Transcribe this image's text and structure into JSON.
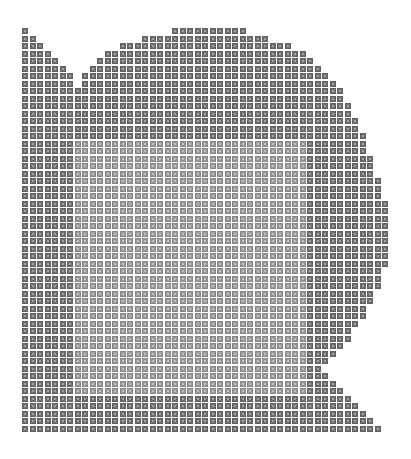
{
  "figure": {
    "grid": {
      "origin_x": 22,
      "origin_y": 28,
      "pitch": 7.5,
      "cell_size": 6
    },
    "colors": {
      "outer": "#6f6f6f",
      "inner": "#9a9a9a",
      "background": "#ffffff"
    },
    "inner_region": {
      "col_start": 7,
      "col_end": 37,
      "row_start": 15,
      "row_end": 48
    },
    "rows": [
      [
        [
          0,
          0
        ],
        [
          20,
          29
        ]
      ],
      [
        [
          0,
          1
        ],
        [
          16,
          32
        ]
      ],
      [
        [
          0,
          2
        ],
        [
          13,
          35
        ]
      ],
      [
        [
          0,
          3
        ],
        [
          11,
          37
        ]
      ],
      [
        [
          0,
          4
        ],
        [
          10,
          38
        ]
      ],
      [
        [
          0,
          5
        ],
        [
          9,
          39
        ]
      ],
      [
        [
          0,
          6
        ],
        [
          8,
          40
        ]
      ],
      [
        [
          0,
          6
        ],
        [
          8,
          41
        ]
      ],
      [
        [
          0,
          42
        ]
      ],
      [
        [
          0,
          42
        ]
      ],
      [
        [
          0,
          43
        ]
      ],
      [
        [
          0,
          43
        ]
      ],
      [
        [
          0,
          44
        ]
      ],
      [
        [
          0,
          44
        ]
      ],
      [
        [
          0,
          45
        ]
      ],
      [
        [
          0,
          45
        ]
      ],
      [
        [
          0,
          45
        ]
      ],
      [
        [
          0,
          46
        ]
      ],
      [
        [
          0,
          46
        ]
      ],
      [
        [
          0,
          46
        ]
      ],
      [
        [
          0,
          47
        ]
      ],
      [
        [
          0,
          47
        ]
      ],
      [
        [
          0,
          47
        ]
      ],
      [
        [
          0,
          48
        ]
      ],
      [
        [
          0,
          48
        ]
      ],
      [
        [
          0,
          48
        ]
      ],
      [
        [
          0,
          48
        ]
      ],
      [
        [
          0,
          48
        ]
      ],
      [
        [
          0,
          48
        ]
      ],
      [
        [
          0,
          48
        ]
      ],
      [
        [
          0,
          48
        ]
      ],
      [
        [
          0,
          48
        ]
      ],
      [
        [
          0,
          47
        ]
      ],
      [
        [
          0,
          47
        ]
      ],
      [
        [
          0,
          47
        ]
      ],
      [
        [
          0,
          46
        ]
      ],
      [
        [
          0,
          46
        ]
      ],
      [
        [
          0,
          45
        ]
      ],
      [
        [
          0,
          45
        ]
      ],
      [
        [
          0,
          44
        ]
      ],
      [
        [
          0,
          43
        ]
      ],
      [
        [
          0,
          43
        ]
      ],
      [
        [
          0,
          42
        ]
      ],
      [
        [
          0,
          41
        ]
      ],
      [
        [
          0,
          40
        ]
      ],
      [
        [
          0,
          39
        ]
      ],
      [
        [
          0,
          40
        ]
      ],
      [
        [
          0,
          41
        ]
      ],
      [
        [
          0,
          42
        ]
      ],
      [
        [
          0,
          43
        ]
      ],
      [
        [
          0,
          44
        ]
      ],
      [
        [
          0,
          45
        ]
      ],
      [
        [
          0,
          46
        ]
      ],
      [
        [
          0,
          47
        ]
      ]
    ]
  }
}
